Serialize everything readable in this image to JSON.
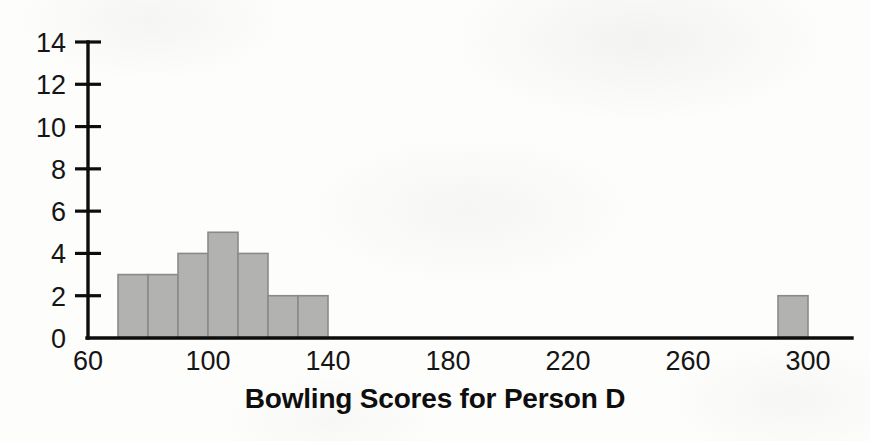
{
  "chart_data": {
    "type": "bar",
    "title": "Bowling Scores for Person D",
    "xlabel": "",
    "ylabel": "",
    "xlim": [
      60,
      310
    ],
    "ylim": [
      0,
      14
    ],
    "grid": false,
    "legend": null,
    "bin_width": 10,
    "x_ticks": [
      60,
      100,
      140,
      180,
      220,
      260,
      300
    ],
    "x_tick_labels": [
      "60",
      "100",
      "140",
      "180",
      "220",
      "260",
      "300"
    ],
    "y_ticks": [
      0,
      2,
      4,
      6,
      8,
      10,
      12,
      14
    ],
    "y_tick_labels": [
      "0",
      "2",
      "4",
      "6",
      "8",
      "10",
      "12",
      "14"
    ],
    "categories": [
      "70-80",
      "80-90",
      "90-100",
      "100-110",
      "110-120",
      "120-130",
      "130-140",
      "290-300"
    ],
    "bin_starts": [
      70,
      80,
      90,
      100,
      110,
      120,
      130,
      290
    ],
    "values": [
      3,
      3,
      4,
      5,
      4,
      2,
      2,
      2
    ],
    "bars": [
      {
        "bin_start": 70,
        "bin_end": 80,
        "value": 3
      },
      {
        "bin_start": 80,
        "bin_end": 90,
        "value": 3
      },
      {
        "bin_start": 90,
        "bin_end": 100,
        "value": 4
      },
      {
        "bin_start": 100,
        "bin_end": 110,
        "value": 5
      },
      {
        "bin_start": 110,
        "bin_end": 120,
        "value": 4
      },
      {
        "bin_start": 120,
        "bin_end": 130,
        "value": 2
      },
      {
        "bin_start": 130,
        "bin_end": 140,
        "value": 2
      },
      {
        "bin_start": 290,
        "bin_end": 300,
        "value": 2
      }
    ],
    "colors": {
      "bar_fill": "#b2b2b0",
      "bar_stroke": "#8a8a88",
      "axis": "#0d0d0d",
      "text": "#111111",
      "background": "#fdfdfc"
    }
  }
}
